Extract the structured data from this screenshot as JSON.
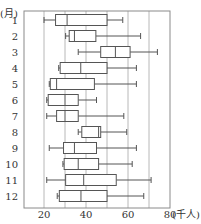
{
  "chart_data": {
    "type": "boxplot",
    "orientation": "horizontal",
    "title": "",
    "ylabel": "(月)",
    "xlabel": "(千人)",
    "xlim": [
      10,
      80
    ],
    "xticks": [
      20,
      40,
      60,
      80
    ],
    "xtick_labels": [
      "20",
      "40",
      "60",
      "80"
    ],
    "minor_gridlines": [
      30,
      50,
      70
    ],
    "grid": true,
    "categories": [
      "1",
      "2",
      "3",
      "4",
      "5",
      "6",
      "7",
      "8",
      "9",
      "10",
      "11",
      "12"
    ],
    "series": [
      {
        "name": "1",
        "min": 20,
        "q1": 25.5,
        "median": 31,
        "q3": 50,
        "max": 57.5
      },
      {
        "name": "2",
        "min": 30.3,
        "q1": 32,
        "median": 34.5,
        "q3": 44.7,
        "max": 66
      },
      {
        "name": "3",
        "min": 36.3,
        "q1": 47,
        "median": 54,
        "q3": 61,
        "max": 74
      },
      {
        "name": "4",
        "min": 27,
        "q1": 27.7,
        "median": 37.5,
        "q3": 50,
        "max": 64
      },
      {
        "name": "5",
        "min": 22.5,
        "q1": 23,
        "median": 26,
        "q3": 44,
        "max": 64
      },
      {
        "name": "6",
        "min": 21.3,
        "q1": 22,
        "median": 30,
        "q3": 36.3,
        "max": 45
      },
      {
        "name": "7",
        "min": 21.3,
        "q1": 26,
        "median": 30,
        "q3": 36.3,
        "max": 58
      },
      {
        "name": "8",
        "min": 36.3,
        "q1": 38,
        "median": 46,
        "q3": 47,
        "max": 59.4
      },
      {
        "name": "9",
        "min": 22.5,
        "q1": 29.3,
        "median": 34.5,
        "q3": 45,
        "max": 64
      },
      {
        "name": "10",
        "min": 29,
        "q1": 29.6,
        "median": 36.3,
        "q3": 46,
        "max": 62
      },
      {
        "name": "11",
        "min": 21.3,
        "q1": 30.3,
        "median": 38.9,
        "q3": 54.4,
        "max": 71
      },
      {
        "name": "12",
        "min": 26.3,
        "q1": 27.3,
        "median": 37.6,
        "q3": 50,
        "max": 67.5
      }
    ]
  },
  "colors": {
    "box": "#555555",
    "grid": "#b8b8b8",
    "frame": "#8a8a8a",
    "text": "#333333"
  }
}
